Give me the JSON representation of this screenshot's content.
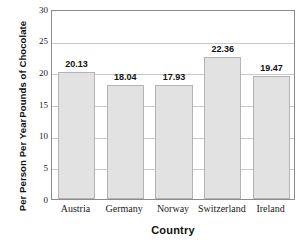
{
  "chart_data": {
    "type": "bar",
    "title": "",
    "categories": [
      "Austria",
      "Germany",
      "Norway",
      "Switzerland",
      "Ireland"
    ],
    "values": [
      20.13,
      18.04,
      17.93,
      22.36,
      19.47
    ],
    "value_labels": [
      "20.13",
      "18.04",
      "17.93",
      "22.36",
      "19.47"
    ],
    "xlabel": "Country",
    "ylabel": "Pounds of Chocolate Per Person Per Year",
    "ylabel_lines": [
      "Pounds of Chocolate",
      "Per Person Per Year"
    ],
    "ylim": [
      0,
      30
    ],
    "ytick_values": [
      0,
      5,
      10,
      15,
      20,
      25,
      30
    ],
    "ytick_labels": [
      "0",
      "5",
      "10",
      "15",
      "20",
      "25",
      "30"
    ],
    "grid": true,
    "grid_axis": "y",
    "legend": false,
    "bar_fill_color": "#e2e2e2",
    "bar_border_color": "#b4b4b4",
    "gridline_color": "#c9c9c9",
    "axis_color": "#8c8c8c",
    "text_color": "#111111"
  }
}
